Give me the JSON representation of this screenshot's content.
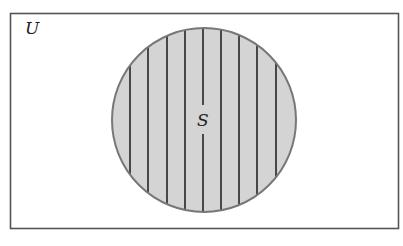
{
  "diagram": {
    "type": "venn",
    "universe": {
      "label": "U",
      "rect": {
        "x": 10.5,
        "y": 13.5,
        "width": 388,
        "height": 215
      },
      "stroke": "#555555",
      "fill": "#ffffff"
    },
    "sets": [
      {
        "label": "S",
        "shaded": true,
        "shading": "vertical-lines",
        "circle": {
          "cx": 204,
          "cy": 120,
          "r": 92
        },
        "fill": "#d4d4d4",
        "stroke": "#777777",
        "hatch_color": "#1a1a1a",
        "hatch_lines_x": [
          130,
          148,
          167,
          185,
          203,
          221,
          239,
          257,
          276
        ]
      }
    ]
  }
}
